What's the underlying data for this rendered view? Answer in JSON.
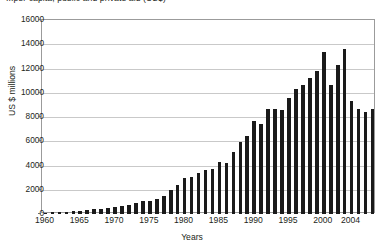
{
  "chart_data": {
    "type": "bar",
    "title": "...per capita, public and private aid (US$)",
    "xlabel": "Years",
    "ylabel": "US $ millions",
    "ylim": [
      0,
      16000
    ],
    "ytick_step": 2000,
    "yticks": [
      0,
      2000,
      4000,
      6000,
      8000,
      10000,
      12000,
      14000,
      16000
    ],
    "xticks": [
      "1960",
      "1965",
      "1970",
      "1975",
      "1980",
      "1985",
      "1990",
      "1995",
      "2000",
      "2004"
    ],
    "xlim": [
      1960,
      2004
    ],
    "grid": true,
    "legend": false,
    "bar_color": "#1a1a1a",
    "categories": [
      "1960",
      "1961",
      "1962",
      "1963",
      "1964",
      "1965",
      "1966",
      "1967",
      "1968",
      "1969",
      "1970",
      "1971",
      "1972",
      "1973",
      "1974",
      "1975",
      "1976",
      "1977",
      "1978",
      "1979",
      "1980",
      "1981",
      "1982",
      "1983",
      "1984",
      "1985",
      "1986",
      "1987",
      "1988",
      "1989",
      "1990",
      "1991",
      "1992",
      "1993",
      "1994",
      "1995",
      "1996",
      "1997",
      "1998",
      "1999",
      "2000",
      "2001",
      "2002",
      "2003",
      "2004"
    ],
    "values": [
      120,
      150,
      170,
      200,
      230,
      260,
      330,
      400,
      430,
      470,
      560,
      700,
      760,
      900,
      1050,
      1100,
      1250,
      1500,
      2000,
      2400,
      3000,
      3050,
      3400,
      3600,
      3750,
      4300,
      4200,
      5100,
      5900,
      6400,
      7700,
      7400,
      8700,
      8700,
      8600,
      9600,
      10300,
      10600,
      11200,
      11800,
      13400,
      14800,
      9700,
      9600,
      9700
    ],
    "values_tail": [
      10600,
      12300,
      13600,
      9300,
      8700,
      8400,
      8700
    ]
  },
  "yaxis": {
    "ticks": [
      {
        "label": "16000",
        "value": 16000
      },
      {
        "label": "14000",
        "value": 14000
      },
      {
        "label": "12000",
        "value": 12000
      },
      {
        "label": "10000",
        "value": 10000
      },
      {
        "label": "8000",
        "value": 8000
      },
      {
        "label": "6000",
        "value": 6000
      },
      {
        "label": "4000",
        "value": 4000
      },
      {
        "label": "2000",
        "value": 2000
      },
      {
        "label": "0",
        "value": 0
      }
    ]
  },
  "xaxis": {
    "ticks": [
      {
        "label": "1960",
        "value": 1960
      },
      {
        "label": "1965",
        "value": 1965
      },
      {
        "label": "1970",
        "value": 1970
      },
      {
        "label": "1975",
        "value": 1975
      },
      {
        "label": "1980",
        "value": 1980
      },
      {
        "label": "1985",
        "value": 1985
      },
      {
        "label": "1990",
        "value": 1990
      },
      {
        "label": "1995",
        "value": 1995
      },
      {
        "label": "2000",
        "value": 2000
      },
      {
        "label": "2004",
        "value": 2004
      }
    ]
  }
}
